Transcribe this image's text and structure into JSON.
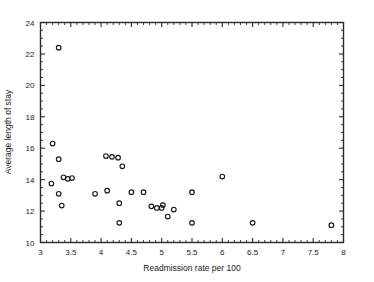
{
  "chart_data": {
    "type": "scatter",
    "title": "",
    "xlabel": "Readmission rate per 100",
    "ylabel": "Average length of stay",
    "xlim": [
      3,
      8
    ],
    "ylim": [
      10,
      24
    ],
    "grid": false,
    "legend": null,
    "xticks": [
      3,
      3.5,
      4,
      4.5,
      5,
      5.5,
      6,
      6.5,
      7,
      7.5,
      8
    ],
    "xtick_labels": [
      "3",
      "3.5",
      "4",
      "4.5",
      "5",
      "5.5",
      "6",
      "6.5",
      "7",
      "7.5",
      "8"
    ],
    "yticks": [
      10,
      12,
      14,
      16,
      18,
      20,
      22,
      24
    ],
    "ytick_labels": [
      "10",
      "12",
      "14",
      "16",
      "18",
      "20",
      "22",
      "24"
    ],
    "x_minor_step": 0.1,
    "y_minor_step": 0.5,
    "marker": "open-circle",
    "marker_size": 4.6,
    "points": [
      {
        "x": 3.3,
        "y": 22.4
      },
      {
        "x": 3.2,
        "y": 16.3
      },
      {
        "x": 3.3,
        "y": 15.3
      },
      {
        "x": 3.18,
        "y": 13.75
      },
      {
        "x": 3.3,
        "y": 13.1
      },
      {
        "x": 3.38,
        "y": 14.15
      },
      {
        "x": 3.45,
        "y": 14.05
      },
      {
        "x": 3.52,
        "y": 14.1
      },
      {
        "x": 3.35,
        "y": 12.35
      },
      {
        "x": 3.9,
        "y": 13.1
      },
      {
        "x": 4.1,
        "y": 13.3
      },
      {
        "x": 4.08,
        "y": 15.5
      },
      {
        "x": 4.18,
        "y": 15.45
      },
      {
        "x": 4.28,
        "y": 15.4
      },
      {
        "x": 4.35,
        "y": 14.85
      },
      {
        "x": 4.3,
        "y": 12.5
      },
      {
        "x": 4.3,
        "y": 11.25
      },
      {
        "x": 4.5,
        "y": 13.2
      },
      {
        "x": 4.7,
        "y": 13.2
      },
      {
        "x": 4.83,
        "y": 12.3
      },
      {
        "x": 4.92,
        "y": 12.2
      },
      {
        "x": 5.0,
        "y": 12.2
      },
      {
        "x": 5.02,
        "y": 12.38
      },
      {
        "x": 5.1,
        "y": 11.65
      },
      {
        "x": 5.2,
        "y": 12.1
      },
      {
        "x": 5.5,
        "y": 13.2
      },
      {
        "x": 5.5,
        "y": 11.25
      },
      {
        "x": 6.0,
        "y": 14.2
      },
      {
        "x": 6.5,
        "y": 11.25
      },
      {
        "x": 7.8,
        "y": 11.1
      }
    ]
  },
  "colors": {
    "marker_stroke": "#1a1a1a",
    "axis": "#2a2a2a",
    "background": "#ffffff"
  }
}
